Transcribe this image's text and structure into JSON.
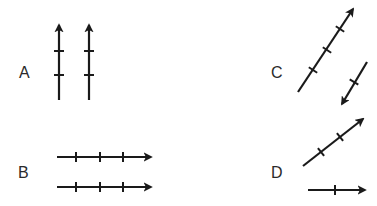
{
  "diagram": {
    "stroke_color": "#1a1a1a",
    "background": "#ffffff",
    "panels": [
      {
        "label": "A",
        "label_pos": [
          19,
          65
        ],
        "arrows": [
          {
            "from": [
              59,
              100
            ],
            "to": [
              59,
              25
            ],
            "ticks": [
              [
                59,
                51
              ],
              [
                59,
                75
              ]
            ]
          },
          {
            "from": [
              89,
              100
            ],
            "to": [
              89,
              25
            ],
            "ticks": [
              [
                89,
                51
              ],
              [
                89,
                75
              ]
            ]
          }
        ]
      },
      {
        "label": "B",
        "label_pos": [
          18,
          165
        ],
        "arrows": [
          {
            "from": [
              57,
              157
            ],
            "to": [
              151,
              157
            ],
            "ticks": [
              [
                76,
                157
              ],
              [
                100,
                157
              ],
              [
                123,
                157
              ]
            ]
          },
          {
            "from": [
              57,
              187
            ],
            "to": [
              151,
              187
            ],
            "ticks": [
              [
                76,
                187
              ],
              [
                100,
                187
              ],
              [
                123,
                187
              ]
            ]
          }
        ]
      },
      {
        "label": "C",
        "label_pos": [
          271,
          65
        ],
        "arrows": [
          {
            "from": [
              298,
              92
            ],
            "to": [
              353,
              9
            ],
            "ticks": [
              [
                313,
                70
              ],
              [
                327,
                50
              ],
              [
                340,
                29
              ]
            ]
          },
          {
            "from": [
              367,
              62
            ],
            "to": [
              342,
              104
            ],
            "ticks": [
              [
                354,
                82
              ]
            ]
          }
        ]
      },
      {
        "label": "D",
        "label_pos": [
          271,
          165
        ],
        "arrows": [
          {
            "from": [
              303,
              166
            ],
            "to": [
              363,
              119
            ],
            "ticks": [
              [
                321,
                152
              ],
              [
                340,
                137
              ]
            ]
          },
          {
            "from": [
              308,
              190
            ],
            "to": [
              365,
              190
            ],
            "ticks": [
              [
                335,
                190
              ]
            ]
          }
        ]
      }
    ]
  }
}
